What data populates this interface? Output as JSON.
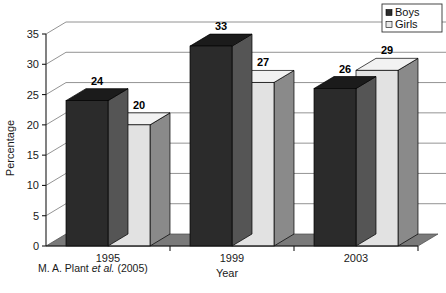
{
  "chart_data": {
    "type": "bar",
    "title": "",
    "subtitle": "",
    "xlabel": "Year",
    "ylabel": "Percentage",
    "categories": [
      "1995",
      "1999",
      "2003"
    ],
    "series": [
      {
        "name": "Boys",
        "values": [
          24,
          33,
          26
        ],
        "color": "#2b2b2b"
      },
      {
        "name": "Girls",
        "values": [
          20,
          27,
          29
        ],
        "color": "#e2e2e2"
      }
    ],
    "ylim": [
      0,
      35
    ],
    "yticks": [
      0,
      5,
      10,
      15,
      20,
      25,
      30,
      35
    ],
    "ytick_labels": [
      "0",
      "5",
      "10",
      "15",
      "20",
      "25",
      "30",
      "35"
    ],
    "grid": true,
    "grid_axis": "y",
    "legend_position": "top-right",
    "legend_entries": [
      {
        "label": "Boys",
        "swatch": "#2b2b2b"
      },
      {
        "label": "Girls",
        "swatch": "#e8e8e8"
      }
    ],
    "data_labels": [
      24,
      20,
      33,
      27,
      26,
      29
    ],
    "style": "3d-column",
    "colors": {
      "bar_dark_front": "#2b2b2b",
      "bar_dark_top": "#1b1b1b",
      "bar_dark_side": "#555555",
      "bar_light_front": "#e2e2e2",
      "bar_light_top": "#f2f2f2",
      "bar_light_side": "#8a8a8a",
      "floor": "#7a7a7a",
      "gridline": "#777777",
      "axis": "#1a1a1a",
      "background": "#ffffff"
    }
  },
  "caption": {
    "prefix": "M. A. Plant ",
    "italic": "et al.",
    "suffix": " (2005)"
  },
  "axis": {
    "y_title": "Percentage",
    "x_title": "Year"
  }
}
